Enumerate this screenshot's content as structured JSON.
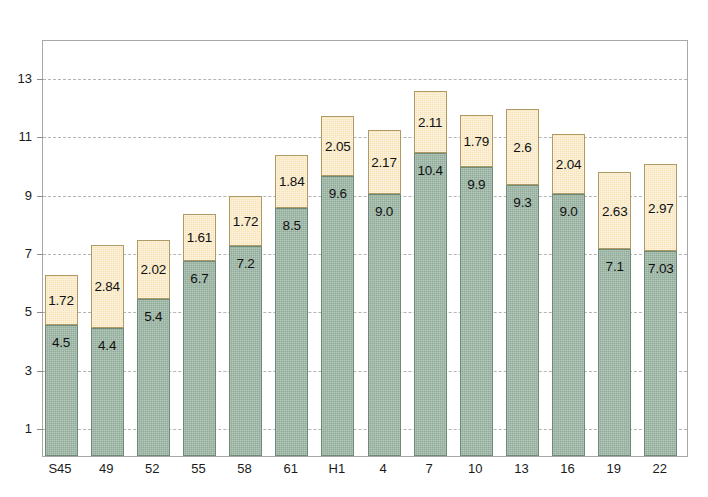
{
  "chart_data": {
    "type": "bar",
    "subtype": "stacked-bar",
    "title": "",
    "xlabel": "",
    "ylabel": "",
    "categories": [
      "S45",
      "49",
      "52",
      "55",
      "58",
      "61",
      "H1",
      "4",
      "7",
      "10",
      "13",
      "16",
      "19",
      "22"
    ],
    "series": [
      {
        "name": "lower",
        "color": "#8fab99",
        "values": [
          4.5,
          4.4,
          5.4,
          6.7,
          7.2,
          8.5,
          9.6,
          9.0,
          10.4,
          9.9,
          9.3,
          9.0,
          7.1,
          7.03
        ],
        "labels": [
          "4.5",
          "4.4",
          "5.4",
          "6.7",
          "7.2",
          "8.5",
          "9.6",
          "9.0",
          "10.4",
          "9.9",
          "9.3",
          "9.0",
          "7.1",
          "7.03"
        ]
      },
      {
        "name": "upper",
        "color": "#f7e3b5",
        "values": [
          1.72,
          2.84,
          2.02,
          1.61,
          1.72,
          1.84,
          2.05,
          2.17,
          2.11,
          1.79,
          2.6,
          2.04,
          2.63,
          2.97
        ],
        "labels": [
          "1.72",
          "2.84",
          "2.02",
          "1.61",
          "1.72",
          "1.84",
          "2.05",
          "2.17",
          "2.11",
          "1.79",
          "2.6",
          "2.04",
          "2.63",
          "2.97"
        ]
      }
    ],
    "totals": [
      6.22,
      7.24,
      7.42,
      8.31,
      8.92,
      10.34,
      11.65,
      11.17,
      12.51,
      11.69,
      11.9,
      11.04,
      9.73,
      10.0
    ],
    "yticks": [
      1,
      3,
      5,
      7,
      9,
      11,
      13
    ],
    "ytick_labels": [
      "1",
      "3",
      "5",
      "7",
      "9",
      "11",
      "13"
    ],
    "ylim": [
      0,
      14.3
    ],
    "grid": true,
    "grid_style": "dashed",
    "grid_color": "#b4b4b4",
    "legend": "none",
    "frame_color": "#a8a8a8",
    "background": "#ffffff"
  }
}
